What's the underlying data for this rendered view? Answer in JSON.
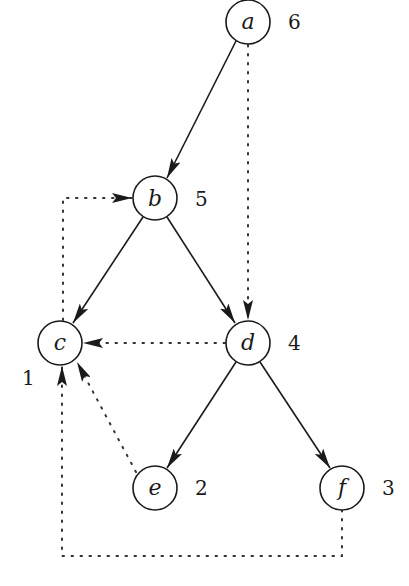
{
  "diagram": {
    "type": "directed-graph-dfs",
    "nodes": [
      {
        "id": "a",
        "label": "a",
        "number": "6",
        "x": 248,
        "y": 22
      },
      {
        "id": "b",
        "label": "b",
        "number": "5",
        "x": 155,
        "y": 198
      },
      {
        "id": "c",
        "label": "c",
        "number": "1",
        "x": 60,
        "y": 343
      },
      {
        "id": "d",
        "label": "d",
        "number": "4",
        "x": 248,
        "y": 343
      },
      {
        "id": "e",
        "label": "e",
        "number": "2",
        "x": 155,
        "y": 488
      },
      {
        "id": "f",
        "label": "f",
        "number": "3",
        "x": 342,
        "y": 488
      }
    ],
    "tree_edges": [
      {
        "from": "a",
        "to": "b",
        "style": "solid"
      },
      {
        "from": "b",
        "to": "c",
        "style": "solid"
      },
      {
        "from": "b",
        "to": "d",
        "style": "solid"
      },
      {
        "from": "d",
        "to": "e",
        "style": "solid"
      },
      {
        "from": "d",
        "to": "f",
        "style": "solid"
      }
    ],
    "non_tree_edges": [
      {
        "from": "a",
        "to": "d",
        "style": "dotted"
      },
      {
        "from": "c",
        "to": "b",
        "style": "dotted"
      },
      {
        "from": "d",
        "to": "c",
        "style": "dotted"
      },
      {
        "from": "e",
        "to": "c",
        "style": "dotted"
      },
      {
        "from": "f",
        "to": "c",
        "style": "dotted"
      }
    ]
  },
  "colors": {
    "stroke": "#1a1a1a",
    "background": "#ffffff"
  }
}
